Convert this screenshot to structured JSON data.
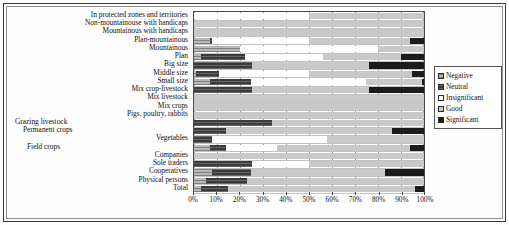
{
  "chart_data": {
    "type": "bar",
    "subtype": "stacked-horizontal-100-percent",
    "title": "",
    "xlabel": "",
    "ylabel": "",
    "xlim": [
      0,
      100
    ],
    "xticks": [
      "0%",
      "10%",
      "20%",
      "30%",
      "40%",
      "50%",
      "60%",
      "70%",
      "80%",
      "90%",
      "100%"
    ],
    "xtick_values": [
      0,
      10,
      20,
      30,
      40,
      50,
      60,
      70,
      80,
      90,
      100
    ],
    "grid": true,
    "legend_position": "right",
    "legend": [
      "Negative",
      "Neutral",
      "Insignificant",
      "Good",
      "Significant"
    ],
    "series_colors": [
      "#b8b8b8",
      "#3b3b3b",
      "#ffffff",
      "#c9c9c9",
      "#1b1b1b"
    ],
    "categories": [
      "In protected zones and territories",
      "Non-mountainouse with handicaps",
      "Mountainous with handicaps",
      "Plan-mountainous",
      "Mountainous",
      "Plan",
      "Big size",
      "Middle size",
      "Small size",
      "Mix crop-livestock",
      "Mix livestock",
      "Mix crops",
      "Pigs, poultry, rabbits",
      "Grazing livestock",
      "Permanent crops",
      "Vegetables",
      "Field crops",
      "Companies",
      "Sole traders",
      "Cooperatives",
      "Physical persons",
      "Total"
    ],
    "category_label_offset": [
      false,
      false,
      false,
      false,
      false,
      false,
      false,
      false,
      false,
      false,
      false,
      false,
      false,
      true,
      true,
      false,
      true,
      false,
      false,
      false,
      false,
      false
    ],
    "series": [
      {
        "name": "Negative",
        "values": [
          0,
          0,
          0,
          7,
          20,
          3,
          0,
          1,
          7,
          0,
          0,
          0,
          0,
          0,
          0,
          0,
          7,
          0,
          0,
          8,
          5,
          3
        ]
      },
      {
        "name": "Neutral",
        "values": [
          0,
          0,
          0,
          1,
          0,
          19,
          25,
          10,
          18,
          25,
          0,
          0,
          0,
          34,
          14,
          8,
          7,
          0,
          25,
          17,
          18,
          12
        ]
      },
      {
        "name": "Insignificant",
        "values": [
          50,
          0,
          0,
          42,
          60,
          34,
          0,
          39,
          50,
          0,
          0,
          0,
          0,
          0,
          0,
          50,
          22,
          0,
          25,
          0,
          0,
          0
        ]
      },
      {
        "name": "Good",
        "values": [
          50,
          100,
          100,
          44,
          20,
          34,
          51,
          45,
          24,
          51,
          100,
          100,
          100,
          66,
          72,
          42,
          58,
          100,
          50,
          58,
          77,
          81
        ]
      },
      {
        "name": "Significant",
        "values": [
          0,
          0,
          0,
          6,
          0,
          10,
          24,
          5,
          1,
          24,
          0,
          0,
          0,
          0,
          14,
          0,
          6,
          0,
          0,
          17,
          0,
          4
        ]
      }
    ],
    "rows": [
      {
        "label": "In protected zones and territories",
        "negative": 0,
        "neutral": 0,
        "insignificant": 50,
        "good": 50,
        "significant": 0
      },
      {
        "label": "Non-mountainouse with handicaps",
        "negative": 0,
        "neutral": 0,
        "insignificant": 0,
        "good": 100,
        "significant": 0
      },
      {
        "label": "Mountainous with handicaps",
        "negative": 0,
        "neutral": 0,
        "insignificant": 0,
        "good": 100,
        "significant": 0
      },
      {
        "label": "Plan-mountainous",
        "negative": 7,
        "neutral": 1,
        "insignificant": 42,
        "good": 44,
        "significant": 6
      },
      {
        "label": "Mountainous",
        "negative": 20,
        "neutral": 0,
        "insignificant": 60,
        "good": 20,
        "significant": 0
      },
      {
        "label": "Plan",
        "negative": 3,
        "neutral": 19,
        "insignificant": 34,
        "good": 34,
        "significant": 10
      },
      {
        "label": "Big size",
        "negative": 0,
        "neutral": 25,
        "insignificant": 0,
        "good": 51,
        "significant": 24
      },
      {
        "label": "Middle size",
        "negative": 1,
        "neutral": 10,
        "insignificant": 39,
        "good": 45,
        "significant": 5
      },
      {
        "label": "Small size",
        "negative": 7,
        "neutral": 18,
        "insignificant": 50,
        "good": 24,
        "significant": 1
      },
      {
        "label": "Mix crop-livestock",
        "negative": 0,
        "neutral": 25,
        "insignificant": 0,
        "good": 51,
        "significant": 24
      },
      {
        "label": "Mix livestock",
        "negative": 0,
        "neutral": 0,
        "insignificant": 0,
        "good": 100,
        "significant": 0
      },
      {
        "label": "Mix crops",
        "negative": 0,
        "neutral": 0,
        "insignificant": 0,
        "good": 100,
        "significant": 0
      },
      {
        "label": "Pigs, poultry, rabbits",
        "negative": 0,
        "neutral": 0,
        "insignificant": 0,
        "good": 100,
        "significant": 0
      },
      {
        "label": "Grazing livestock",
        "negative": 0,
        "neutral": 34,
        "insignificant": 0,
        "good": 66,
        "significant": 0
      },
      {
        "label": "Permanent crops",
        "negative": 0,
        "neutral": 14,
        "insignificant": 0,
        "good": 72,
        "significant": 14
      },
      {
        "label": "Vegetables",
        "negative": 0,
        "neutral": 8,
        "insignificant": 50,
        "good": 42,
        "significant": 0
      },
      {
        "label": "Field crops",
        "negative": 7,
        "neutral": 7,
        "insignificant": 22,
        "good": 58,
        "significant": 6
      },
      {
        "label": "Companies",
        "negative": 0,
        "neutral": 0,
        "insignificant": 0,
        "good": 100,
        "significant": 0
      },
      {
        "label": "Sole traders",
        "negative": 0,
        "neutral": 25,
        "insignificant": 25,
        "good": 50,
        "significant": 0
      },
      {
        "label": "Cooperatives",
        "negative": 8,
        "neutral": 17,
        "insignificant": 0,
        "good": 58,
        "significant": 17
      },
      {
        "label": "Physical persons",
        "negative": 5,
        "neutral": 18,
        "insignificant": 0,
        "good": 77,
        "significant": 0
      },
      {
        "label": "Total",
        "negative": 3,
        "neutral": 12,
        "insignificant": 0,
        "good": 81,
        "significant": 4
      }
    ]
  }
}
